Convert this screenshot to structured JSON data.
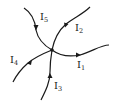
{
  "diagram": {
    "title": "",
    "node": {
      "x": 52,
      "y": 50
    },
    "branches": [
      {
        "id": "I1",
        "label": "I",
        "subscript": "1",
        "direction": "out"
      },
      {
        "id": "I2",
        "label": "I",
        "subscript": "2",
        "direction": "out"
      },
      {
        "id": "I3",
        "label": "I",
        "subscript": "3",
        "direction": "in"
      },
      {
        "id": "I4",
        "label": "I",
        "subscript": "4",
        "direction": "out"
      },
      {
        "id": "I5",
        "label": "I",
        "subscript": "5",
        "direction": "in"
      }
    ],
    "colors": {
      "stroke": "#1a1a1a",
      "background": "#ffffff"
    }
  }
}
